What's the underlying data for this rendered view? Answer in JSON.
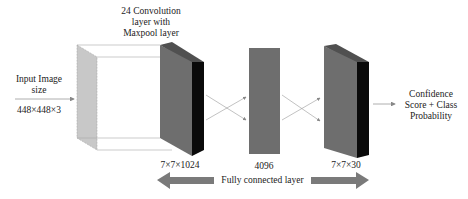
{
  "diagram": {
    "input": {
      "line1": "Input Image",
      "line2": "size",
      "dims": "448×448×3"
    },
    "conv": {
      "line1": "24 Convolution",
      "line2": "layer with",
      "line3": "Maxpool layer",
      "dims": "7×7×1024"
    },
    "fc1": {
      "dims": "4096"
    },
    "out_block": {
      "dims": "7×7×30"
    },
    "output": {
      "line1": "Confidence",
      "line2": "Score + Class",
      "line3": "Probability"
    },
    "fc_label": "Fully connected layer",
    "colors": {
      "input_face": "#c8c8c8",
      "block_front": "#6e6e6e",
      "block_top": "#505050",
      "block_side": "#0a0a0a",
      "arrow_band": "#7a7a7a"
    }
  }
}
